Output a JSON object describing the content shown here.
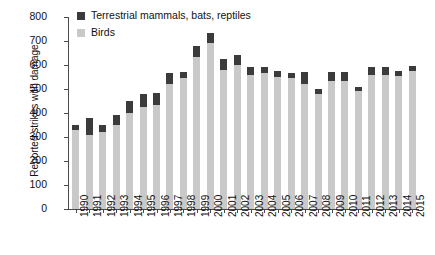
{
  "chart_data": {
    "type": "bar",
    "subtype": "stacked-column",
    "title": "",
    "xlabel": "",
    "ylabel": "Reported strikes with damage",
    "ylim": [
      0,
      800
    ],
    "ytick_step": 100,
    "yticks": [
      0,
      100,
      200,
      300,
      400,
      500,
      600,
      700,
      800
    ],
    "grid": false,
    "legend_position": "top-left-inside",
    "categories": [
      "1990",
      "1991",
      "1992",
      "1993",
      "1994",
      "1995",
      "1996",
      "1997",
      "1998",
      "1999",
      "2000",
      "2001",
      "2002",
      "2003",
      "2004",
      "2005",
      "2006",
      "2007",
      "2008",
      "2009",
      "2010",
      "2011",
      "2012",
      "2013",
      "2014",
      "2015"
    ],
    "series": [
      {
        "name": "Birds",
        "color": "#c9c9c9",
        "values": [
          330,
          310,
          320,
          350,
          400,
          425,
          435,
          520,
          545,
          635,
          690,
          580,
          600,
          560,
          565,
          550,
          545,
          520,
          480,
          535,
          535,
          490,
          560,
          560,
          555,
          575
        ]
      },
      {
        "name": "Terrestrial mammals, bats, reptiles",
        "color": "#3b3b3b",
        "values": [
          22,
          70,
          30,
          40,
          50,
          55,
          50,
          45,
          25,
          45,
          45,
          45,
          40,
          30,
          25,
          25,
          20,
          50,
          20,
          35,
          35,
          20,
          30,
          30,
          20,
          20
        ]
      }
    ],
    "totals": [
      352,
      380,
      350,
      390,
      450,
      480,
      485,
      565,
      570,
      680,
      735,
      625,
      640,
      590,
      590,
      575,
      565,
      570,
      500,
      570,
      570,
      510,
      590,
      590,
      575,
      595
    ]
  },
  "legend": {
    "items": [
      {
        "label": "Terrestrial mammals, bats, reptiles",
        "swatch": "dark-swatch-icon"
      },
      {
        "label": "Birds",
        "swatch": "light-swatch-icon"
      }
    ]
  }
}
